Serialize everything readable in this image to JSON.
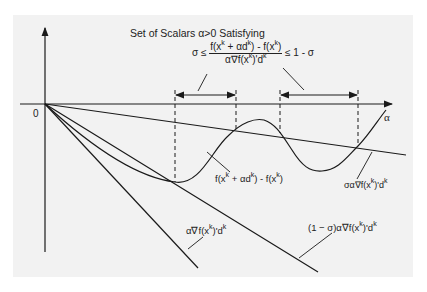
{
  "title": "Set of Scalars α>0 Satisfying",
  "condition": {
    "lhs": "σ ≤",
    "numerator": [
      "f(x",
      "k",
      " + αd",
      "k",
      ") - f(x",
      "k",
      ")"
    ],
    "denominator": [
      "α∇f(x",
      "k",
      ")'d",
      "k"
    ],
    "rhs": "≤ 1 - σ"
  },
  "axes": {
    "origin_label": "0",
    "x_label": "α"
  },
  "curves": {
    "function_diff": [
      "f(x",
      "k",
      " + αd",
      "k",
      ") - f(x",
      "k",
      ")"
    ],
    "sigma_line": [
      "σα∇f(x",
      "k",
      ")'d",
      "k"
    ],
    "gradient_line": [
      "α∇f(x",
      "k",
      ")'d",
      "k"
    ],
    "one_minus_sigma_line": [
      "(1 − σ)α∇f(x",
      "k",
      ")'d",
      "k"
    ]
  },
  "intervals": [
    {
      "start_x": 175,
      "end_x": 236
    },
    {
      "start_x": 280,
      "end_x": 358
    }
  ],
  "colors": {
    "background": "#f2f2f2",
    "stroke": "#1a1a1a"
  }
}
